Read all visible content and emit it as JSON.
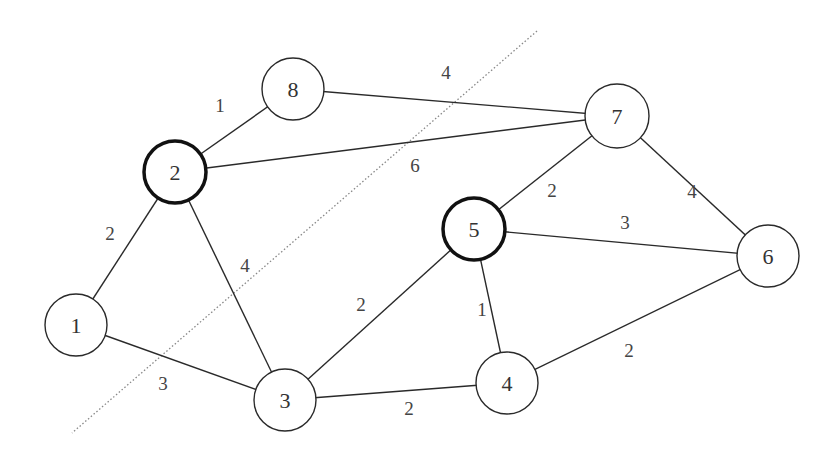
{
  "diagram": {
    "type": "weighted-undirected-graph",
    "cut_line": {
      "x1": 537,
      "y1": 31,
      "x2": 72,
      "y2": 433,
      "style": "dotted"
    },
    "nodes": [
      {
        "id": "1",
        "label": "1",
        "cx": 76,
        "cy": 325,
        "r": 31,
        "highlighted": false
      },
      {
        "id": "2",
        "label": "2",
        "cx": 175,
        "cy": 172,
        "r": 31,
        "highlighted": true
      },
      {
        "id": "3",
        "label": "3",
        "cx": 285,
        "cy": 400,
        "r": 31,
        "highlighted": false
      },
      {
        "id": "4",
        "label": "4",
        "cx": 507,
        "cy": 383,
        "r": 31,
        "highlighted": false
      },
      {
        "id": "5",
        "label": "5",
        "cx": 474,
        "cy": 229,
        "r": 31,
        "highlighted": true
      },
      {
        "id": "6",
        "label": "6",
        "cx": 768,
        "cy": 256,
        "r": 31,
        "highlighted": false
      },
      {
        "id": "7",
        "label": "7",
        "cx": 617,
        "cy": 116,
        "r": 32,
        "highlighted": false
      },
      {
        "id": "8",
        "label": "8",
        "cx": 293,
        "cy": 89,
        "r": 31,
        "highlighted": false
      }
    ],
    "edges": [
      {
        "from": "2",
        "to": "8",
        "weight": "1",
        "lx": 220,
        "ly": 105
      },
      {
        "from": "8",
        "to": "7",
        "weight": "4",
        "lx": 446,
        "ly": 72
      },
      {
        "from": "2",
        "to": "7",
        "weight": "6",
        "lx": 415,
        "ly": 165
      },
      {
        "from": "1",
        "to": "2",
        "weight": "2",
        "lx": 110,
        "ly": 233
      },
      {
        "from": "2",
        "to": "3",
        "weight": "4",
        "lx": 245,
        "ly": 265
      },
      {
        "from": "1",
        "to": "3",
        "weight": "3",
        "lx": 163,
        "ly": 383
      },
      {
        "from": "3",
        "to": "5",
        "weight": "2",
        "lx": 361,
        "ly": 304
      },
      {
        "from": "3",
        "to": "4",
        "weight": "2",
        "lx": 409,
        "ly": 408
      },
      {
        "from": "5",
        "to": "4",
        "weight": "1",
        "lx": 482,
        "ly": 309
      },
      {
        "from": "7",
        "to": "5",
        "weight": "2",
        "lx": 552,
        "ly": 190
      },
      {
        "from": "5",
        "to": "6",
        "weight": "3",
        "lx": 625,
        "ly": 222
      },
      {
        "from": "7",
        "to": "6",
        "weight": "4",
        "lx": 692,
        "ly": 191
      },
      {
        "from": "4",
        "to": "6",
        "weight": "2",
        "lx": 629,
        "ly": 350
      }
    ]
  }
}
